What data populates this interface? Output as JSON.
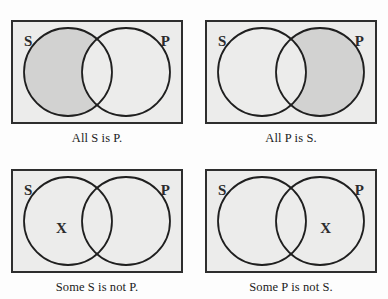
{
  "figure": {
    "colors": {
      "page_background": "#fdfdfd",
      "box_background": "#ececeb",
      "shaded_region": "#d2d2d1",
      "box_border": "#2e2e2e",
      "circle_stroke": "#1f1f1f",
      "text": "#1b1b1b"
    },
    "geometry": {
      "box_width": 172,
      "box_height": 104,
      "circle_radius": 45,
      "circle_left_cx": 57,
      "circle_right_cx": 115,
      "circle_cy": 52
    }
  },
  "panels": [
    {
      "id": "all-s-is-p",
      "caption": "All S is P.",
      "left_label": "S",
      "right_label": "P",
      "shading": "s-only",
      "marker": null,
      "marker_label": ""
    },
    {
      "id": "all-p-is-s",
      "caption": "All P is S.",
      "left_label": "S",
      "right_label": "P",
      "shading": "p-only",
      "marker": null,
      "marker_label": ""
    },
    {
      "id": "some-s-is-not-p",
      "caption": "Some S is not P.",
      "left_label": "S",
      "right_label": "P",
      "shading": "none",
      "marker": "s-only",
      "marker_label": "X"
    },
    {
      "id": "some-p-is-not-s",
      "caption": "Some P is not S.",
      "left_label": "S",
      "right_label": "P",
      "shading": "none",
      "marker": "p-only",
      "marker_label": "X"
    }
  ]
}
